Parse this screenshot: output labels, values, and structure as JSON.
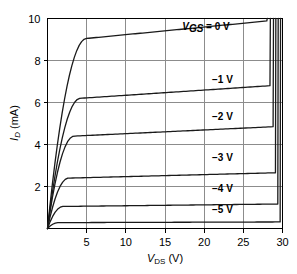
{
  "chart_data": {
    "type": "line",
    "title": "",
    "subtitle": "",
    "xlabel": "V_DS (V)",
    "xlabel_main": "V",
    "xlabel_sub": "DS",
    "xlabel_unit": " (V)",
    "ylabel": "I_D (mA)",
    "ylabel_main": "I",
    "ylabel_sub": "D",
    "ylabel_unit": " (mA)",
    "xlim": [
      0,
      30
    ],
    "ylim": [
      0,
      10
    ],
    "xticks": [
      5,
      10,
      15,
      20,
      25,
      30
    ],
    "yticks": [
      2,
      4,
      6,
      8,
      10
    ],
    "xtick_labels": [
      "5",
      "10",
      "15",
      "20",
      "25",
      "30"
    ],
    "ytick_labels": [
      "2",
      "4",
      "6",
      "8",
      "10"
    ],
    "grid": true,
    "legend_position": "inline-annotations",
    "series": [
      {
        "name": "VGS = 0 V",
        "label_main": "V",
        "label_sub": "GS",
        "label_rest": " = 0 V",
        "vgs": 0,
        "idss_sat": 9.05,
        "knee_v": 5.0,
        "breakdown_v": 28.0,
        "label_x": 17.2,
        "label_y": 9.45
      },
      {
        "name": "-1 V",
        "label_main": "−1 V",
        "vgs": -1,
        "idss_sat": 6.2,
        "knee_v": 4.2,
        "breakdown_v": 28.4,
        "label_x": 21.0,
        "label_y": 6.95
      },
      {
        "name": "-2 V",
        "label_main": "−2 V",
        "vgs": -2,
        "idss_sat": 4.4,
        "knee_v": 3.4,
        "breakdown_v": 28.8,
        "label_x": 21.0,
        "label_y": 5.15
      },
      {
        "name": "-3 V",
        "label_main": "−3 V",
        "vgs": -3,
        "idss_sat": 2.4,
        "knee_v": 2.7,
        "breakdown_v": 29.1,
        "label_x": 21.0,
        "label_y": 3.2
      },
      {
        "name": "-4 V",
        "label_main": "−4 V",
        "vgs": -4,
        "idss_sat": 1.05,
        "knee_v": 2.0,
        "breakdown_v": 29.4,
        "label_x": 21.0,
        "label_y": 1.75
      },
      {
        "name": "-5 V",
        "label_main": "−5 V",
        "vgs": -5,
        "idss_sat": 0.28,
        "knee_v": 1.4,
        "breakdown_v": 29.7,
        "label_x": 21.0,
        "label_y": 0.72
      }
    ],
    "colors": {
      "curve": "#1a1a1a",
      "grid": "#8c8c8c",
      "frame": "#000000",
      "background": "#ffffff"
    }
  }
}
